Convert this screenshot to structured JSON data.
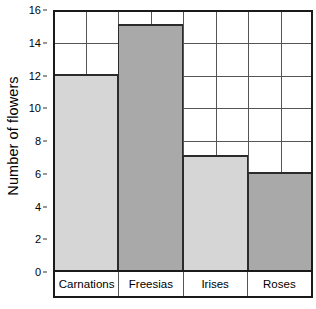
{
  "chart_data": {
    "type": "bar",
    "title": "",
    "xlabel": "",
    "ylabel": "Number of flowers",
    "categories": [
      "Carnations",
      "Freesias",
      "Irises",
      "Roses"
    ],
    "values": [
      12,
      15,
      7,
      6
    ],
    "ylim": [
      0,
      16
    ],
    "ytick_labels": [
      "0",
      "2",
      "4",
      "6",
      "8",
      "10",
      "12",
      "14",
      "16"
    ],
    "ytick_values": [
      0,
      2,
      4,
      6,
      8,
      10,
      12,
      14,
      16
    ],
    "grid": {
      "horizontal": true,
      "horizontal_at": [
        2,
        4,
        6,
        8,
        10,
        12,
        14
      ],
      "vertical": true,
      "vertical_columns": 8
    },
    "legend": null,
    "bar_colors": [
      "#d6d6d6",
      "#a9a9a9",
      "#d6d6d6",
      "#a9a9a9"
    ],
    "bar_edge_color": "#2b2b2b",
    "axis_color": "#1a1a1a",
    "gridline_color": "#555555",
    "background_color": "#ffffff",
    "text_color": "#000000"
  }
}
